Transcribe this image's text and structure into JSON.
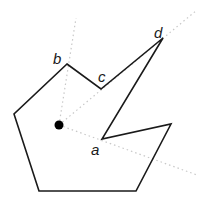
{
  "diagram": {
    "type": "polygon-visibility",
    "colors": {
      "background": "#ffffff",
      "polygon_stroke": "#1a1a1a",
      "ray_stroke": "#c8c8c8",
      "point_fill": "#000000"
    },
    "viewpoint": {
      "x": 59,
      "y": 125
    },
    "polygon_points": "67,64 101,89 163,38 102,139 171,124 136,191 39,191 14,114",
    "rays": [
      {
        "name": "ray-through-b",
        "x1": 59,
        "y1": 125,
        "x2": 76,
        "y2": 18
      },
      {
        "name": "ray-through-c-d",
        "x1": 59,
        "y1": 125,
        "x2": 197,
        "y2": 10
      },
      {
        "name": "ray-through-a",
        "x1": 59,
        "y1": 125,
        "x2": 197,
        "y2": 175
      }
    ],
    "labels": {
      "a": {
        "text": "a",
        "x": 91,
        "y": 155
      },
      "b": {
        "text": "b",
        "x": 53,
        "y": 64
      },
      "c": {
        "text": "c",
        "x": 98,
        "y": 82
      },
      "d": {
        "text": "d",
        "x": 154,
        "y": 38
      }
    }
  }
}
